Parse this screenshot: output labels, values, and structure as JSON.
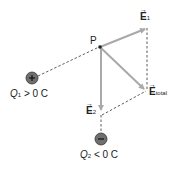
{
  "diagram": {
    "point_label": "P",
    "vectors": {
      "e1": {
        "symbol": "E",
        "subscript": "1"
      },
      "e2": {
        "symbol": "E",
        "subscript": "2"
      },
      "etotal": {
        "symbol": "E",
        "subscript": "total"
      }
    },
    "charges": {
      "q1": {
        "sign": "+",
        "var": "Q",
        "sub": "1",
        "relation": " > 0  C"
      },
      "q2": {
        "sign": "−",
        "var": "Q",
        "sub": "2",
        "relation": " < 0  C"
      }
    },
    "colors": {
      "vector": "#a9a9a9",
      "dashed": "#333333",
      "charge_fill": "#6f6f6f"
    }
  }
}
